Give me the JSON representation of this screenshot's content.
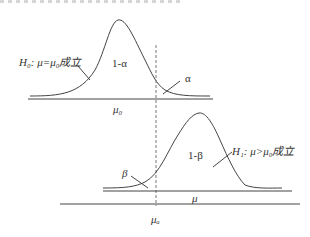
{
  "diagram": {
    "type": "hypothesis-test-distributions",
    "top_curve": {
      "hypothesis_label": "H₀: μ=μ₀成立",
      "center_region_label": "1-α",
      "tail_label": "α",
      "axis_label": "μ₀"
    },
    "bottom_curve": {
      "hypothesis_label": "H₁: μ>μ₀成立",
      "center_region_label": "1-β",
      "tail_label": "β",
      "axis_label": "μ"
    },
    "critical_value_label": "μₐ",
    "colors": {
      "stroke": "#444444",
      "dash": "#777777",
      "text": "#333333"
    }
  }
}
